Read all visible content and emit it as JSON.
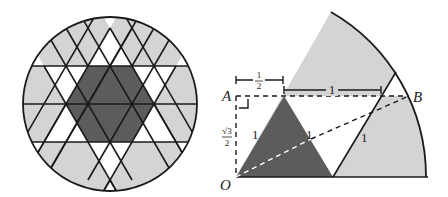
{
  "colors": {
    "dark": "#5c5c5c",
    "light": "#d4d4d4",
    "white": "#ffffff",
    "stroke": "#1a1a1a"
  },
  "left_figure": {
    "description": "Circle tiled by triangular grid; central dark hexagon, white star points, light gray outer regions"
  },
  "right_figure": {
    "points": {
      "A": "A",
      "B": "B",
      "O": "O"
    },
    "labels": {
      "half_top": "1",
      "half_bottom": "2",
      "one_top": "1",
      "sqrt3_num": "√3",
      "sqrt3_den": "2",
      "side_left": "1",
      "side_mid": "1",
      "side_right": "1"
    }
  }
}
